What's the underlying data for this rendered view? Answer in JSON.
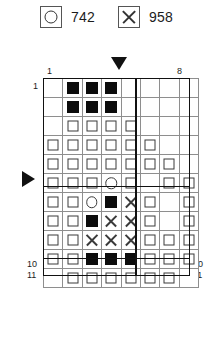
{
  "legend": {
    "entries": [
      {
        "icon": "circle-icon",
        "label": "742"
      },
      {
        "icon": "x-icon",
        "label": "958"
      }
    ]
  },
  "markers": {
    "top": {
      "name": "column-pointer-triangle",
      "glyph": "▼",
      "points_to_column": 5
    },
    "left": {
      "name": "row-pointer-triangle",
      "glyph": "▶",
      "points_to_row": 6
    }
  },
  "axis": {
    "top_left": "1",
    "top_right": "8",
    "bottom_left": "1",
    "bottom_right": "8",
    "left_first": "1",
    "left_tenth": "10",
    "left_eleventh": "11",
    "right_first": "1",
    "right_tenth": "10",
    "right_eleventh": "11"
  },
  "grid": {
    "columns": 8,
    "rows": 11,
    "cells": [
      [
        "empty",
        "filled-square",
        "filled-square",
        "filled-square",
        "empty",
        "empty",
        "empty",
        "empty"
      ],
      [
        "empty",
        "filled-square",
        "filled-square",
        "filled-square",
        "empty",
        "empty",
        "empty",
        "empty"
      ],
      [
        "empty",
        "open-square",
        "open-square",
        "open-square",
        "open-square",
        "empty",
        "empty",
        "empty"
      ],
      [
        "open-square",
        "open-square",
        "open-square",
        "open-square",
        "open-square",
        "open-square",
        "empty",
        "empty"
      ],
      [
        "open-square",
        "open-square",
        "open-square",
        "open-square",
        "open-square",
        "open-square",
        "open-square",
        "empty"
      ],
      [
        "open-square",
        "open-square",
        "open-square",
        "circle",
        "open-square",
        "empty",
        "open-square",
        "open-square"
      ],
      [
        "open-square",
        "open-square",
        "circle",
        "filled-square",
        "cross",
        "open-square",
        "empty",
        "open-square"
      ],
      [
        "open-square",
        "open-square",
        "filled-square",
        "cross",
        "cross",
        "open-square",
        "empty",
        "open-square"
      ],
      [
        "open-square",
        "open-square",
        "cross",
        "cross",
        "cross",
        "open-square",
        "open-square",
        "open-square"
      ],
      [
        "open-square",
        "open-square",
        "filled-square",
        "filled-square",
        "filled-square",
        "open-square",
        "open-square",
        "open-square"
      ],
      [
        "empty",
        "open-square",
        "open-square",
        "open-square",
        "open-square",
        "open-square",
        "open-square",
        "empty"
      ]
    ]
  },
  "colors": {
    "ink": "#111111",
    "grid_line": "#8e8e8e",
    "glyph": "#3a3a3a",
    "background": "#ffffff"
  }
}
